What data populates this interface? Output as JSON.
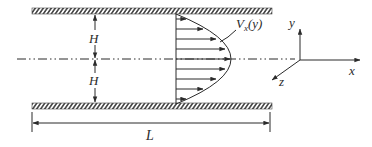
{
  "diagram": {
    "labels": {
      "half_height_top": "H",
      "half_height_bottom": "H",
      "velocity_profile_main": "V",
      "velocity_profile_sub": "x",
      "velocity_profile_arg": "(y)",
      "length": "L",
      "axis_x": "x",
      "axis_y": "y",
      "axis_z": "z"
    },
    "colors": {
      "line": "#2b2b2b",
      "hatch": "#4a4a4a",
      "background": "#ffffff"
    }
  }
}
